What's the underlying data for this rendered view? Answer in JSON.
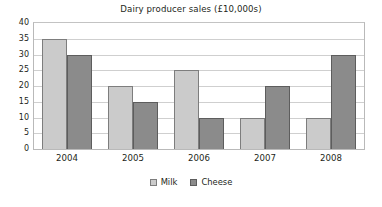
{
  "chart_data": {
    "type": "bar",
    "title": "Dairy producer sales (£10,000s)",
    "xlabel": "",
    "ylabel": "",
    "categories": [
      "2004",
      "2005",
      "2006",
      "2007",
      "2008"
    ],
    "series": [
      {
        "name": "Milk",
        "color": "#cbcbcb",
        "values": [
          35,
          20,
          25,
          10,
          10
        ]
      },
      {
        "name": "Cheese",
        "color": "#8b8b8b",
        "values": [
          30,
          15,
          10,
          20,
          30
        ]
      }
    ],
    "ylim": [
      0,
      40
    ],
    "ytick_step": 5,
    "yticks": [
      0,
      5,
      10,
      15,
      20,
      25,
      30,
      35,
      40
    ],
    "ytick_labels": [
      "0",
      "5",
      "10",
      "15",
      "20",
      "25",
      "30",
      "35",
      "40"
    ],
    "grid": true,
    "grid_axis": "y",
    "legend_position": "bottom",
    "legend": [
      "Milk",
      "Cheese"
    ]
  }
}
